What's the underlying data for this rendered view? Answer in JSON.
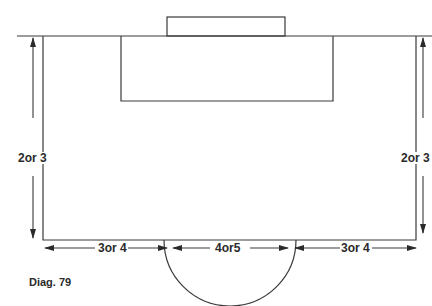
{
  "diagram": {
    "caption": "Diag. 79",
    "labels": {
      "left_height": "2or 3",
      "right_height": "2or 3",
      "bottom_left": "3or 4",
      "bottom_center": "4or5",
      "bottom_right": "3or 4"
    },
    "colors": {
      "line": "#3a3a3a",
      "background": "#ffffff"
    }
  }
}
